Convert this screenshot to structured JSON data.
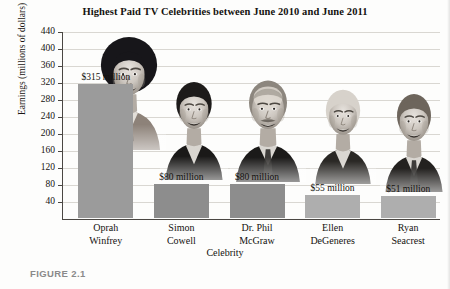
{
  "figure": {
    "caption": "FIGURE 2.1"
  },
  "chart_data": {
    "type": "bar",
    "title": "Highest Paid TV Celebrities between June 2010 and June 2011",
    "xlabel": "Celebrity",
    "ylabel": "Earnings (millions of dollars)",
    "ylim": [
      0,
      440
    ],
    "grid": true,
    "legend": "none",
    "categories": [
      "Oprah Winfrey",
      "Simon Cowell",
      "Dr. Phil McGraw",
      "Ellen DeGeneres",
      "Ryan Seacrest"
    ],
    "category_lines": [
      [
        "Oprah",
        "Winfrey"
      ],
      [
        "Simon",
        "Cowell"
      ],
      [
        "Dr. Phil",
        "McGraw"
      ],
      [
        "Ellen",
        "DeGeneres"
      ],
      [
        "Ryan",
        "Seacrest"
      ]
    ],
    "values": [
      315,
      80,
      80,
      55,
      51
    ],
    "data_labels": [
      "$315 million",
      "$80 million",
      "$80 million",
      "$55 million",
      "$51 million"
    ],
    "ytick_labels": [
      "40",
      "80",
      "120",
      "160",
      "200",
      "240",
      "280",
      "320",
      "360",
      "400",
      "440"
    ],
    "ytick_values": [
      40,
      80,
      120,
      160,
      200,
      240,
      280,
      320,
      360,
      400,
      440
    ],
    "bar_colors": [
      "#9b9b9b",
      "#8d8d8d",
      "#8d8d8d",
      "#aeaeae",
      "#aeaeae"
    ],
    "photo_names": [
      "oprah-winfrey-photo",
      "simon-cowell-photo",
      "dr-phil-mcgraw-photo",
      "ellen-degeneres-photo",
      "ryan-seacrest-photo"
    ]
  }
}
